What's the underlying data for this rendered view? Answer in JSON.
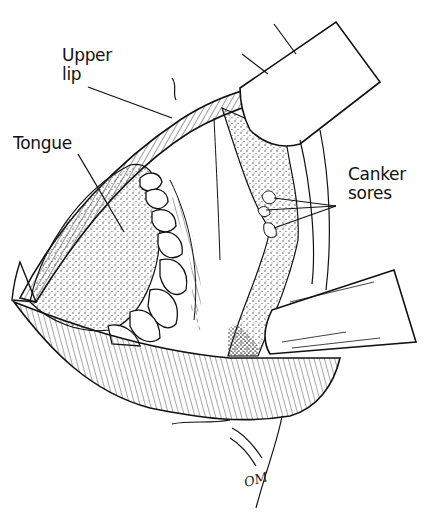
{
  "figure": {
    "type": "anatomical line illustration",
    "colors": {
      "ink": "#111111",
      "background": "#ffffff",
      "stipple": "#333333"
    }
  },
  "labels": {
    "upper_lip_line1": "Upper",
    "upper_lip_line2": "lip",
    "tongue": "Tongue",
    "canker_line1": "Canker",
    "canker_line2": "sores"
  },
  "signature": "OM"
}
